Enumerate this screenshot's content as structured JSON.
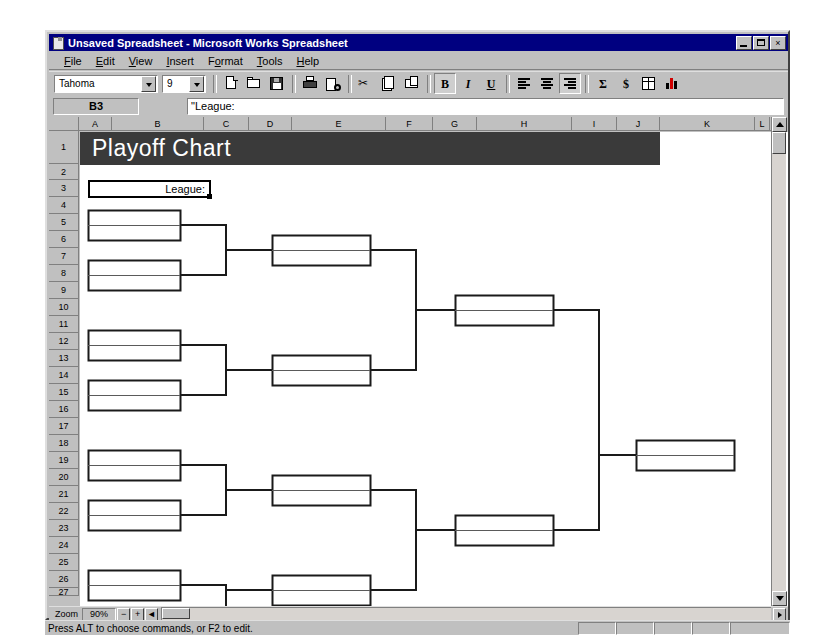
{
  "window": {
    "title": "Unsaved Spreadsheet - Microsoft Works Spreadsheet",
    "minimize_label": "Minimize",
    "restore_label": "Restore",
    "close_label": "×"
  },
  "menu": {
    "items": [
      {
        "label": "File",
        "accel": "F"
      },
      {
        "label": "Edit",
        "accel": "E"
      },
      {
        "label": "View",
        "accel": "V"
      },
      {
        "label": "Insert",
        "accel": "I"
      },
      {
        "label": "Format",
        "accel": "o"
      },
      {
        "label": "Tools",
        "accel": "T"
      },
      {
        "label": "Help",
        "accel": "H"
      }
    ]
  },
  "toolbar": {
    "font_name": "Tahoma",
    "font_size": "9",
    "buttons": [
      {
        "name": "new-document-button",
        "icon": "new-document-icon",
        "label": "New"
      },
      {
        "name": "open-button",
        "icon": "open-folder-icon",
        "label": "Open"
      },
      {
        "name": "save-button",
        "icon": "save-disk-icon",
        "label": "Save"
      },
      {
        "name": "print-button",
        "icon": "printer-icon",
        "label": "Print"
      },
      {
        "name": "print-preview-button",
        "icon": "print-preview-icon",
        "label": "Print Preview"
      },
      {
        "name": "cut-button",
        "icon": "scissors-icon",
        "label": "Cut"
      },
      {
        "name": "copy-button",
        "icon": "copy-icon",
        "label": "Copy"
      },
      {
        "name": "paste-button",
        "icon": "paste-icon",
        "label": "Paste"
      },
      {
        "name": "bold-button",
        "icon": "bold-icon",
        "label": "B"
      },
      {
        "name": "italic-button",
        "icon": "italic-icon",
        "label": "I"
      },
      {
        "name": "underline-button",
        "icon": "underline-icon",
        "label": "U"
      },
      {
        "name": "align-left-button",
        "icon": "align-left-icon",
        "label": "Align Left"
      },
      {
        "name": "align-center-button",
        "icon": "align-center-icon",
        "label": "Align Center"
      },
      {
        "name": "align-right-button",
        "icon": "align-right-icon",
        "label": "Align Right"
      },
      {
        "name": "autosum-button",
        "icon": "sigma-icon",
        "label": "Σ"
      },
      {
        "name": "currency-button",
        "icon": "currency-icon",
        "label": "$"
      },
      {
        "name": "easy-calc-button",
        "icon": "table-icon",
        "label": "Easy Calc"
      },
      {
        "name": "chart-button",
        "icon": "bar-chart-icon",
        "label": "New Chart"
      }
    ]
  },
  "formula_bar": {
    "cell_reference": "B3",
    "formula_value": "\"League:",
    "placeholder": ""
  },
  "grid": {
    "columns": [
      "A",
      "B",
      "C",
      "D",
      "E",
      "F",
      "G",
      "H",
      "I",
      "J",
      "K",
      "L",
      "M"
    ],
    "column_widths": [
      33,
      92,
      45,
      43,
      94,
      47,
      44,
      95,
      45,
      43,
      95,
      15,
      17
    ],
    "rows": [
      "1",
      "2",
      "3",
      "4",
      "5",
      "6",
      "7",
      "8",
      "9",
      "10",
      "11",
      "12",
      "13",
      "14",
      "15",
      "16",
      "17",
      "18",
      "19",
      "20",
      "21",
      "22",
      "23",
      "24",
      "25",
      "26",
      "27"
    ],
    "row_heights": [
      33,
      16,
      17,
      17,
      17,
      17,
      17,
      17,
      17,
      17,
      17,
      17,
      17,
      17,
      17,
      17,
      17,
      17,
      17,
      17,
      17,
      17,
      17,
      17,
      17,
      17,
      8
    ],
    "selected_cell": "B3"
  },
  "sheet": {
    "title": "Playoff Chart",
    "title_banner_color": "#3a3a3a",
    "title_text_color": "#ffffff",
    "league_label": "League:"
  },
  "chart_data": {
    "type": "diagram",
    "subtype": "single-elimination-bracket",
    "title": "Playoff Chart",
    "label_field": "League:",
    "rounds": 5,
    "note": "Empty tournament bracket template; no team names entered. Each box has two blank name slots separated by a mid divider.",
    "boxes": [
      {
        "round": 1,
        "x": 8,
        "y": 78,
        "w": 92,
        "h": 30
      },
      {
        "round": 1,
        "x": 8,
        "y": 128,
        "w": 92,
        "h": 30
      },
      {
        "round": 1,
        "x": 8,
        "y": 198,
        "w": 92,
        "h": 30
      },
      {
        "round": 1,
        "x": 8,
        "y": 248,
        "w": 92,
        "h": 30
      },
      {
        "round": 1,
        "x": 8,
        "y": 318,
        "w": 92,
        "h": 30
      },
      {
        "round": 1,
        "x": 8,
        "y": 368,
        "w": 92,
        "h": 30
      },
      {
        "round": 1,
        "x": 8,
        "y": 438,
        "w": 92,
        "h": 30
      },
      {
        "round": 2,
        "x": 192,
        "y": 103,
        "w": 98,
        "h": 30
      },
      {
        "round": 2,
        "x": 192,
        "y": 223,
        "w": 98,
        "h": 30
      },
      {
        "round": 2,
        "x": 192,
        "y": 343,
        "w": 98,
        "h": 30
      },
      {
        "round": 2,
        "x": 192,
        "y": 443,
        "w": 98,
        "h": 30
      },
      {
        "round": 3,
        "x": 375,
        "y": 163,
        "w": 98,
        "h": 30
      },
      {
        "round": 3,
        "x": 375,
        "y": 383,
        "w": 98,
        "h": 30
      },
      {
        "round": 4,
        "x": 556,
        "y": 308,
        "w": 98,
        "h": 30
      }
    ],
    "connectors": 13
  },
  "zoom_bar": {
    "label": "Zoom",
    "value": "90%",
    "zoom_out_label": "−",
    "zoom_in_label": "+",
    "scroll_left_label": "◄",
    "scroll_right_label": "►"
  },
  "status_bar": {
    "message": "Press ALT to choose commands, or F2 to edit."
  }
}
